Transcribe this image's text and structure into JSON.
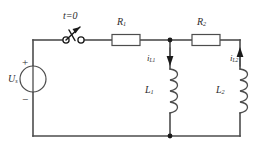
{
  "figure": {
    "type": "electrical-circuit-schematic"
  },
  "labels": {
    "switch": {
      "text": "t=0",
      "symbol": "single-pole-switch-open"
    },
    "source": {
      "name": "U",
      "subscript": "s",
      "plus": "+",
      "minus": "−",
      "symbol": "voltage-source-circle"
    },
    "r1": {
      "name": "R",
      "subscript": "1",
      "symbol": "resistor-box"
    },
    "r2": {
      "name": "R",
      "subscript": "2",
      "symbol": "resistor-box"
    },
    "l1": {
      "name": "L",
      "subscript": "1",
      "symbol": "inductor-coil"
    },
    "l2": {
      "name": "L",
      "subscript": "2",
      "symbol": "inductor-coil"
    },
    "il1": {
      "name": "i",
      "subscript": "L1",
      "direction": "down"
    },
    "il2": {
      "name": "i",
      "subscript": "L2",
      "direction": "up"
    }
  },
  "colors": {
    "wire": "#4d4d4d",
    "ink": "#1a1a1a",
    "background": "#ffffff"
  }
}
